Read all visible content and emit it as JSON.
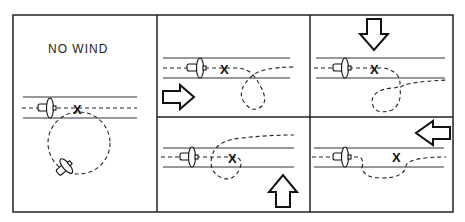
{
  "panels": [
    {
      "id": "no-wind",
      "label": "NO WIND",
      "wind_direction": "none"
    },
    {
      "id": "wind-from-left",
      "label": "",
      "wind_direction": "right"
    },
    {
      "id": "wind-from-top",
      "label": "",
      "wind_direction": "down"
    },
    {
      "id": "wind-from-bottom",
      "label": "",
      "wind_direction": "up"
    },
    {
      "id": "wind-from-right",
      "label": "",
      "wind_direction": "left"
    }
  ],
  "marker": "X"
}
